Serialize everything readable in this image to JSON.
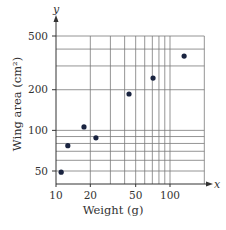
{
  "chart_data": {
    "type": "scatter",
    "title": "",
    "xlabel": "Weight (g)",
    "ylabel": "Wing area (cm²)",
    "x_axis_var": "x",
    "y_axis_var": "y",
    "xscale": "log",
    "yscale": "log",
    "xlim": [
      10,
      200
    ],
    "ylim": [
      50,
      500
    ],
    "xticks": [
      10,
      20,
      50,
      100
    ],
    "xtick_labels": [
      "10",
      "20",
      "50",
      "100"
    ],
    "yticks": [
      50,
      100,
      200,
      500
    ],
    "ytick_labels": [
      "50",
      "100",
      "200",
      "500"
    ],
    "x_gridlines": [
      10,
      20,
      30,
      40,
      50,
      60,
      70,
      80,
      90,
      100,
      200
    ],
    "y_gridlines": [
      50,
      60,
      70,
      80,
      90,
      100,
      200,
      300,
      400,
      500
    ],
    "grid": true,
    "legend": null,
    "series": [
      {
        "name": "birds",
        "color": "#1a2440",
        "points": [
          {
            "x": 11.1,
            "y": 49
          },
          {
            "x": 12.7,
            "y": 77
          },
          {
            "x": 17.6,
            "y": 106
          },
          {
            "x": 22.4,
            "y": 88
          },
          {
            "x": 43.7,
            "y": 186
          },
          {
            "x": 71,
            "y": 244
          },
          {
            "x": 133,
            "y": 355
          }
        ]
      }
    ]
  },
  "colors": {
    "grid": "#7a7a7a",
    "axis": "#333333",
    "point": "#1a2440"
  }
}
